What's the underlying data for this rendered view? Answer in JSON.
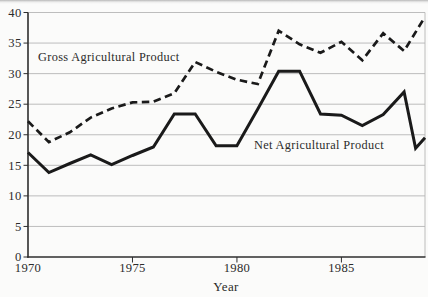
{
  "figure": {
    "xlabel": "Year",
    "gross_label": "Gross Agricultural Product",
    "net_label": "Net Agricultural Product"
  },
  "chart_data": {
    "type": "line",
    "title": "",
    "xlabel": "Year",
    "ylabel": "",
    "xlim": [
      1970,
      1989
    ],
    "ylim": [
      0,
      40
    ],
    "x_tick_labels": [
      1970,
      1975,
      1980,
      1985
    ],
    "x_tick_marks": [
      1975,
      1980,
      1985
    ],
    "y_ticks": [
      0,
      5,
      10,
      15,
      20,
      25,
      30,
      35,
      40
    ],
    "grid": "horizontal-light",
    "legend": "inline-labels",
    "series": [
      {
        "key": "gross",
        "name": "Gross Agricultural Product",
        "line_style": "dashed",
        "color": "#1a1a1a",
        "x": [
          1970,
          1971,
          1972,
          1973,
          1974,
          1975,
          1976,
          1977,
          1978,
          1979,
          1980,
          1981,
          1982,
          1983,
          1984,
          1985,
          1986,
          1987,
          1988,
          1989
        ],
        "values": [
          22.2,
          18.8,
          20.4,
          22.8,
          24.3,
          25.3,
          25.4,
          26.8,
          31.9,
          30.3,
          29.0,
          28.3,
          37.0,
          34.8,
          33.4,
          35.2,
          32.2,
          36.6,
          33.7,
          39.3
        ]
      },
      {
        "key": "net",
        "name": "Net Agricultural Product",
        "line_style": "solid",
        "color": "#1a1a1a",
        "x": [
          1970,
          1971,
          1972,
          1973,
          1974,
          1975,
          1976,
          1977,
          1978,
          1979,
          1980,
          1981,
          1982,
          1983,
          1984,
          1985,
          1986,
          1987,
          1988,
          1988.55,
          1989
        ],
        "values": [
          17.1,
          13.8,
          15.3,
          16.7,
          15.1,
          16.6,
          18.0,
          23.4,
          23.4,
          18.2,
          18.2,
          24.2,
          30.4,
          30.4,
          23.4,
          23.2,
          21.5,
          23.3,
          27.0,
          17.8,
          19.5
        ]
      }
    ]
  },
  "colors": {
    "line": "#1a1a1a",
    "grid": "#b5b5b5",
    "axis": "#2e2e2e",
    "text": "#2b2b2b",
    "background": "#fbfbfa"
  }
}
